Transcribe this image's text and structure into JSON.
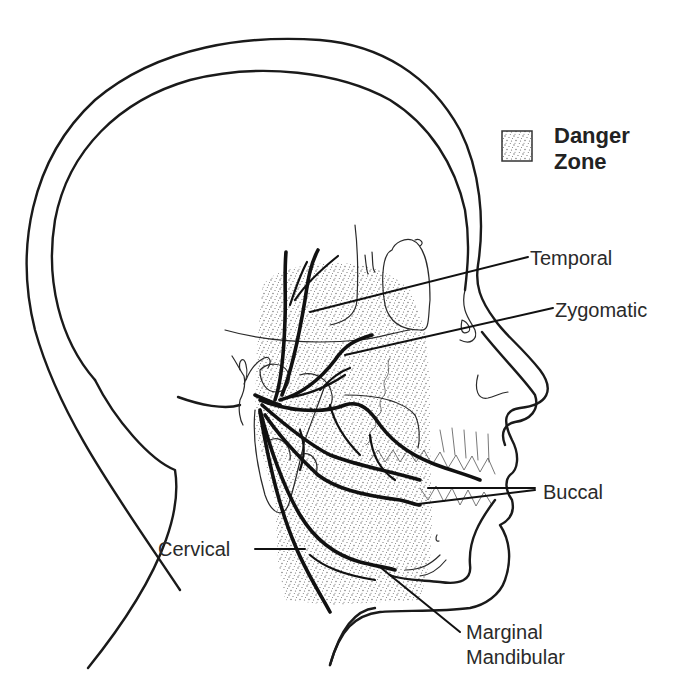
{
  "diagram": {
    "legend": {
      "swatch": "stippled-pattern",
      "line1": "Danger",
      "line2": "Zone"
    },
    "labels": {
      "temporal": "Temporal",
      "zygomatic": "Zygomatic",
      "buccal": "Buccal",
      "cervical": "Cervical",
      "marginal_line1": "Marginal",
      "marginal_line2": "Mandibular"
    },
    "colors": {
      "ink": "#111111",
      "stipple": "#6b6b6b",
      "background": "#ffffff"
    }
  }
}
